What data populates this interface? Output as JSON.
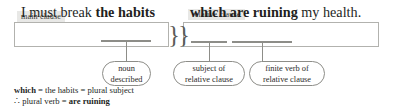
{
  "diagram": {
    "tags": {
      "main_clause": "main clause",
      "relative_clause": "relative clause"
    },
    "sentence": {
      "main_clause": {
        "plain_before": "I must break ",
        "bold_noun": "the habits"
      },
      "relative_clause": {
        "bold_which": "which ",
        "bold_verb": "are ruining",
        "plain_after": " my health."
      }
    },
    "brace": "}}",
    "callouts": [
      {
        "line1": "noun",
        "line2": "described"
      },
      {
        "line1": "subject of",
        "line2": "relative clause"
      },
      {
        "line1": "finite verb of",
        "line2": "relative clause"
      }
    ],
    "notes": {
      "line1_bold": "which",
      "line1_rest": " = the habits = plural subject",
      "line2_symbol": "∴ ",
      "line2_rest": "plural verb = ",
      "line2_bold": "are ruining"
    },
    "colors": {
      "tag_background": "#e8e8e6",
      "box_border": "#b2b2ae",
      "underline": "#8d8d88",
      "text": "#231f1e"
    }
  }
}
